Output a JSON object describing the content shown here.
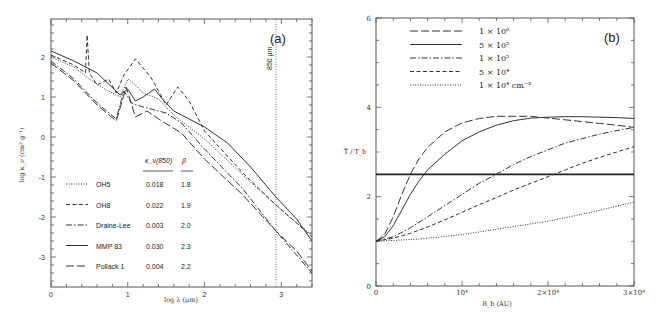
{
  "chart_data": [
    {
      "type": "line",
      "panel_label": "(a)",
      "title": "",
      "xlabel": "log λ (μm)",
      "ylabel": "log κ_ν (cm² g⁻¹)",
      "xlim": [
        0,
        3.4
      ],
      "ylim": [
        -3.75,
        2.95
      ],
      "xticks": [
        "0",
        "1",
        "2",
        "3"
      ],
      "yticks": [
        "-3",
        "-2",
        "-1",
        "0",
        "1",
        "2"
      ],
      "grid": false,
      "annotation": {
        "text": "850 μm",
        "x": 2.93,
        "type": "vertical-dotted-line"
      },
      "legend_position": "lower-left",
      "table_headers": [
        "κ_ν(850)",
        "β"
      ],
      "series": [
        {
          "name": "OH5",
          "style": "dotted",
          "kappa850": "0.018",
          "beta": "1.8",
          "x": [
            0,
            0.3,
            0.5,
            0.7,
            0.9,
            1.0,
            1.1,
            1.2,
            1.4,
            1.6,
            2.0,
            2.5,
            2.93,
            3.2,
            3.4
          ],
          "y": [
            2.0,
            1.75,
            1.45,
            1.2,
            1.0,
            1.45,
            1.3,
            1.1,
            0.95,
            0.55,
            -0.05,
            -0.95,
            -1.7,
            -2.15,
            -2.45
          ]
        },
        {
          "name": "OH8",
          "style": "dashed",
          "kappa850": "0.022",
          "beta": "1.9",
          "x": [
            0,
            0.3,
            0.45,
            0.47,
            0.5,
            0.6,
            0.75,
            0.85,
            0.95,
            1.1,
            1.3,
            1.5,
            1.65,
            1.8,
            2.0,
            2.5,
            2.93,
            3.2,
            3.4
          ],
          "y": [
            2.05,
            1.8,
            1.6,
            2.55,
            1.6,
            1.3,
            1.45,
            1.1,
            1.55,
            1.95,
            1.5,
            0.8,
            1.25,
            0.9,
            0.15,
            -0.9,
            -1.7,
            -2.15,
            -2.5
          ]
        },
        {
          "name": "Draine-Lee",
          "style": "dash-dot",
          "kappa850": "0.003",
          "beta": "2.0",
          "x": [
            0,
            0.3,
            0.6,
            0.85,
            0.95,
            1.05,
            1.2,
            1.5,
            1.7,
            2.0,
            2.5,
            2.93,
            3.4
          ],
          "y": [
            1.9,
            1.45,
            0.85,
            0.45,
            1.15,
            0.85,
            0.75,
            0.6,
            0.35,
            -0.3,
            -1.3,
            -2.35,
            -3.4
          ]
        },
        {
          "name": "MMP 83",
          "style": "solid",
          "kappa850": "0.030",
          "beta": "2.3",
          "x": [
            0,
            0.3,
            0.6,
            0.9,
            1.0,
            1.1,
            1.2,
            1.35,
            1.45,
            1.6,
            2.0,
            2.3,
            2.6,
            2.93,
            3.2,
            3.4
          ],
          "y": [
            2.15,
            1.9,
            1.6,
            1.05,
            1.2,
            0.9,
            1.0,
            1.2,
            0.95,
            0.65,
            0.25,
            -0.15,
            -0.75,
            -1.5,
            -2.05,
            -2.6
          ]
        },
        {
          "name": "Pollack 1",
          "style": "long-dash",
          "kappa850": "0.004",
          "beta": "2.2",
          "x": [
            0,
            0.3,
            0.6,
            0.85,
            0.98,
            1.1,
            1.25,
            1.4,
            1.7,
            2.0,
            2.5,
            2.93,
            3.2,
            3.4
          ],
          "y": [
            1.85,
            1.4,
            0.8,
            0.4,
            1.25,
            0.5,
            0.65,
            0.45,
            0.1,
            -0.55,
            -1.45,
            -2.35,
            -2.85,
            -3.35
          ]
        }
      ]
    },
    {
      "type": "line",
      "panel_label": "(b)",
      "title": "",
      "xlabel": "R_b (AU)",
      "ylabel": "T̄ / T_b",
      "xlim": [
        0,
        30000
      ],
      "ylim": [
        0,
        6
      ],
      "xticks": [
        "0",
        "10⁴",
        "2×10⁴",
        "3×10⁴"
      ],
      "yticks": [
        "0",
        "2",
        "4",
        "6"
      ],
      "grid": false,
      "legend_position": "upper-left",
      "reference_line": {
        "y": 2.5,
        "style": "solid-thick"
      },
      "series": [
        {
          "name": "1 × 10⁶",
          "style": "long-dash",
          "x": [
            0,
            1000,
            2000,
            3000,
            4000,
            5000,
            6000,
            8000,
            10000,
            12000,
            14000,
            16000,
            18000,
            20000,
            22000,
            24000,
            26000,
            28000,
            30000
          ],
          "y": [
            1.0,
            1.15,
            1.55,
            2.05,
            2.5,
            2.85,
            3.1,
            3.45,
            3.65,
            3.75,
            3.8,
            3.8,
            3.8,
            3.76,
            3.72,
            3.68,
            3.64,
            3.6,
            3.55
          ]
        },
        {
          "name": "5 × 10⁵",
          "style": "solid",
          "x": [
            0,
            1000,
            2000,
            3000,
            4000,
            5000,
            6000,
            8000,
            10000,
            12000,
            14000,
            16000,
            18000,
            20000,
            22000,
            24000,
            26000,
            28000,
            30000
          ],
          "y": [
            1.0,
            1.1,
            1.35,
            1.7,
            2.05,
            2.35,
            2.6,
            2.95,
            3.25,
            3.45,
            3.6,
            3.7,
            3.76,
            3.78,
            3.79,
            3.79,
            3.78,
            3.77,
            3.75
          ]
        },
        {
          "name": "1 × 10⁵",
          "style": "dash-dot",
          "x": [
            0,
            2000,
            4000,
            6000,
            8000,
            10000,
            12000,
            14000,
            16000,
            18000,
            20000,
            22000,
            24000,
            26000,
            28000,
            30000
          ],
          "y": [
            1.0,
            1.1,
            1.3,
            1.55,
            1.8,
            2.05,
            2.3,
            2.5,
            2.72,
            2.9,
            3.05,
            3.2,
            3.3,
            3.4,
            3.48,
            3.55
          ]
        },
        {
          "name": "5 × 10⁴",
          "style": "dashed",
          "x": [
            0,
            2000,
            4000,
            6000,
            8000,
            10000,
            12000,
            14000,
            16000,
            18000,
            20000,
            22000,
            24000,
            26000,
            28000,
            30000
          ],
          "y": [
            1.0,
            1.07,
            1.18,
            1.32,
            1.48,
            1.65,
            1.82,
            1.98,
            2.15,
            2.3,
            2.45,
            2.6,
            2.75,
            2.88,
            3.0,
            3.12
          ]
        },
        {
          "name": "1 × 10⁴ cm⁻³",
          "style": "dotted",
          "x": [
            0,
            5000,
            10000,
            15000,
            20000,
            25000,
            30000
          ],
          "y": [
            1.0,
            1.05,
            1.15,
            1.3,
            1.45,
            1.65,
            1.88
          ]
        }
      ]
    }
  ]
}
